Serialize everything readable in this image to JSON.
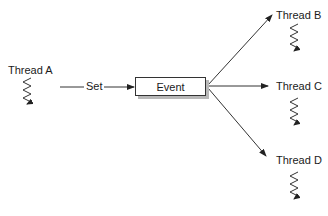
{
  "diagram": {
    "type": "event-signaling",
    "source_thread": {
      "label": "Thread A"
    },
    "action": {
      "label": "Set"
    },
    "event": {
      "label": "Event"
    },
    "target_threads": [
      {
        "label": "Thread B"
      },
      {
        "label": "Thread C"
      },
      {
        "label": "Thread D"
      }
    ]
  },
  "colors": {
    "line": "#333333",
    "shadow": "#b8b8b8",
    "text": "#1a1a1a"
  }
}
